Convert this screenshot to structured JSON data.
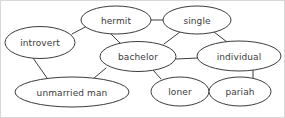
{
  "diagram": {
    "type": "node-link-graph",
    "background_color": "#ffffff",
    "stroke_color": "#3c3c3c",
    "text_color": "#3a3a3a",
    "border_color": "#d8d8d8",
    "nodes": [
      {
        "id": "introvert",
        "label": "introvert",
        "cx": 39,
        "cy": 41.5,
        "rx": 35,
        "ry": 16
      },
      {
        "id": "hermit",
        "label": "hermit",
        "cx": 115,
        "cy": 19,
        "rx": 35,
        "ry": 14
      },
      {
        "id": "single",
        "label": "single",
        "cx": 196,
        "cy": 19,
        "rx": 34,
        "ry": 14
      },
      {
        "id": "bachelor",
        "label": "bachelor",
        "cx": 137,
        "cy": 55.5,
        "rx": 38,
        "ry": 15
      },
      {
        "id": "individual",
        "label": "individual",
        "cx": 238,
        "cy": 55,
        "rx": 42,
        "ry": 15
      },
      {
        "id": "unmarried-man",
        "label": "unmarried man",
        "cx": 71,
        "cy": 91,
        "rx": 57,
        "ry": 15
      },
      {
        "id": "loner",
        "label": "loner",
        "cx": 179,
        "cy": 90.5,
        "rx": 29,
        "ry": 14.5
      },
      {
        "id": "pariah",
        "label": "pariah",
        "cx": 239,
        "cy": 90.5,
        "rx": 31,
        "ry": 14.5
      }
    ],
    "edges": [
      {
        "from": "introvert",
        "to": "hermit",
        "x1": 71,
        "y1": 33,
        "x2": 88,
        "y2": 24
      },
      {
        "from": "hermit",
        "to": "single",
        "x1": 150,
        "y1": 19,
        "x2": 162,
        "y2": 19
      },
      {
        "from": "hermit",
        "to": "bachelor",
        "x1": 110,
        "y1": 33,
        "x2": 119,
        "y2": 42
      },
      {
        "from": "single",
        "to": "bachelor",
        "x1": 179,
        "y1": 31,
        "x2": 163,
        "y2": 43
      },
      {
        "from": "single",
        "to": "individual",
        "x1": 213,
        "y1": 31,
        "x2": 226,
        "y2": 41
      },
      {
        "from": "bachelor",
        "to": "individual",
        "x1": 175,
        "y1": 58,
        "x2": 197,
        "y2": 57
      },
      {
        "from": "introvert",
        "to": "unmarried-man",
        "x1": 32,
        "y1": 57,
        "x2": 46,
        "y2": 77
      },
      {
        "from": "bachelor",
        "to": "unmarried-man",
        "x1": 105,
        "y1": 67,
        "x2": 92,
        "y2": 78
      },
      {
        "from": "bachelor",
        "to": "loner",
        "x1": 152,
        "y1": 69,
        "x2": 160,
        "y2": 78
      },
      {
        "from": "loner",
        "to": "pariah",
        "x1": 207,
        "y1": 90,
        "x2": 211,
        "y2": 90
      },
      {
        "from": "individual",
        "to": "pariah",
        "x1": 252,
        "y1": 69,
        "x2": 252,
        "y2": 77
      }
    ]
  }
}
